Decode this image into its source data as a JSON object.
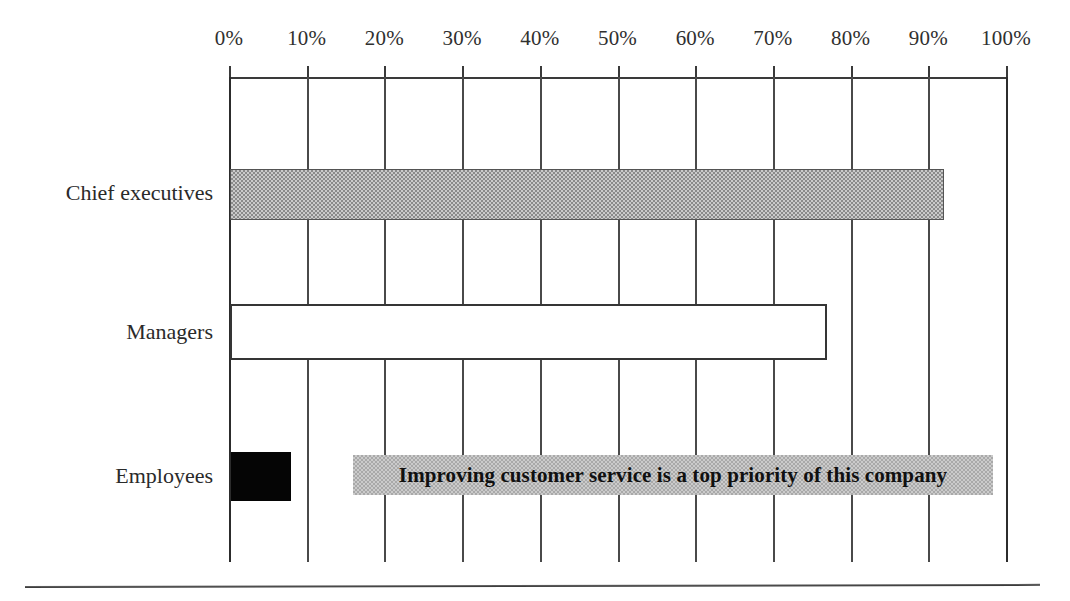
{
  "chart_data": {
    "type": "bar",
    "orientation": "horizontal",
    "title": "",
    "subtitle": "",
    "xlabel": "",
    "ylabel": "",
    "categories": [
      "Chief executives",
      "Managers",
      "Employees"
    ],
    "values": [
      92,
      77,
      8
    ],
    "value_suffix": "%",
    "xlim": [
      0,
      100
    ],
    "xticks": [
      0,
      10,
      20,
      30,
      40,
      50,
      60,
      70,
      80,
      90,
      100
    ],
    "xtick_labels": [
      "0%",
      "10%",
      "20%",
      "30%",
      "40%",
      "50%",
      "60%",
      "70%",
      "80%",
      "90%",
      "100%"
    ],
    "grid": true,
    "grid_axis": "x",
    "axis_position": "top",
    "legend": false,
    "legend_position": "none",
    "annotations": [
      {
        "text": "Improving customer service is a top priority of this company",
        "style": "gray-band-bold"
      }
    ],
    "series": [
      {
        "name": "Agreement",
        "values": [
          92,
          77,
          8
        ],
        "bar_styles": [
          "hatched-gray",
          "white-outline",
          "solid-black"
        ]
      }
    ],
    "colors": {
      "chief_executives_bar": "#8a8a8a",
      "managers_bar": "#ffffff",
      "employees_bar": "#050505",
      "annotation_band": "#a9a9a9",
      "gridline": "#4a4a4a",
      "axis": "#3a3a3a",
      "text": "#2a2a2a",
      "background": "#ffffff"
    }
  }
}
